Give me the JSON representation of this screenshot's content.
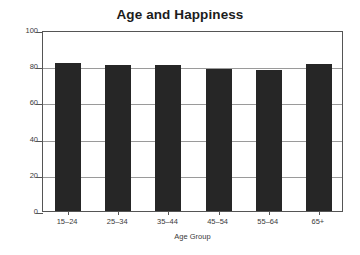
{
  "chart_data": {
    "type": "bar",
    "title": "Age and Happiness",
    "xlabel": "Age Group",
    "ylabel": "",
    "categories": [
      "15–24",
      "25–34",
      "35–44",
      "45–54",
      "55–64",
      "65+"
    ],
    "values": [
      82,
      80.5,
      80.5,
      78.5,
      78,
      81
    ],
    "ylim": [
      0,
      100
    ],
    "yticks": [
      0,
      20,
      40,
      60,
      80,
      100
    ],
    "ytick_labels": [
      "0",
      "20",
      "40",
      "60",
      "80",
      "100"
    ],
    "grid": "horizontal",
    "legend": "none",
    "bar_color": "#262626",
    "frame_color": "#555555",
    "grid_color": "#9a9a9a",
    "background": "#ffffff",
    "title_color": "#1c1c1c"
  }
}
